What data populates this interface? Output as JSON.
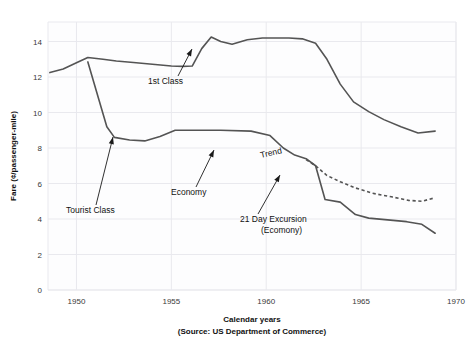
{
  "chart_data": {
    "type": "line",
    "title": "",
    "xlabel": "Calendar years",
    "xsublabel": "(Source: US Department of Commerce)",
    "ylabel": "Fare (¢/passenger-mile)",
    "xlim": [
      1948.5,
      1970.0
    ],
    "ylim": [
      0,
      15.1
    ],
    "xticks": [
      1950,
      1955,
      1960,
      1965,
      1970
    ],
    "xtick_labels": [
      "1950",
      "1955",
      "1960",
      "1965",
      "1970"
    ],
    "yticks": [
      0,
      2,
      4,
      6,
      8,
      10,
      12,
      14
    ],
    "ytick_labels": [
      "0",
      "2",
      "4",
      "6",
      "8",
      "10",
      "12",
      "14"
    ],
    "grid": true,
    "legend_position": "none",
    "line_color": "#545454",
    "series": [
      {
        "name": "1st Class",
        "style": "solid",
        "x": [
          1948.6,
          1949.3,
          1950.0,
          1950.6,
          1951.4,
          1952.1,
          1953.0,
          1954.0,
          1955.0,
          1955.6,
          1956.1,
          1956.6,
          1957.1,
          1957.6,
          1958.2,
          1959.0,
          1959.8,
          1960.6,
          1961.2,
          1961.9,
          1962.6,
          1963.2,
          1963.9,
          1964.6,
          1965.4,
          1966.2,
          1967.1,
          1968.0,
          1968.9
        ],
        "y": [
          12.25,
          12.45,
          12.8,
          13.1,
          13.0,
          12.9,
          12.82,
          12.72,
          12.62,
          12.6,
          12.62,
          13.6,
          14.25,
          14.0,
          13.85,
          14.1,
          14.2,
          14.2,
          14.2,
          14.15,
          13.9,
          13.0,
          11.6,
          10.6,
          10.05,
          9.6,
          9.2,
          8.85,
          8.95
        ]
      },
      {
        "name": "Tourist Class / Economy",
        "style": "solid",
        "x": [
          1950.6,
          1951.6,
          1952.0,
          1952.8,
          1953.6,
          1954.4,
          1955.2,
          1956.2,
          1957.6,
          1959.2,
          1960.2,
          1960.9,
          1961.5,
          1962.1,
          1962.6,
          1963.1,
          1963.9,
          1964.7,
          1965.4,
          1966.4,
          1967.4,
          1968.2,
          1968.9
        ],
        "y": [
          12.85,
          9.2,
          8.6,
          8.45,
          8.4,
          8.65,
          9.0,
          9.0,
          9.0,
          8.95,
          8.7,
          8.0,
          7.6,
          7.4,
          7.0,
          5.1,
          4.95,
          4.25,
          4.05,
          3.95,
          3.85,
          3.7,
          3.2
        ]
      },
      {
        "name": "21 Day Excursion (Ecomony)",
        "style": "dashed",
        "x": [
          1962.1,
          1962.6,
          1963.2,
          1963.9,
          1964.7,
          1965.6,
          1966.6,
          1967.5,
          1968.2,
          1968.9
        ],
        "y": [
          7.35,
          7.0,
          6.45,
          6.1,
          5.75,
          5.45,
          5.25,
          5.05,
          5.0,
          5.2
        ]
      }
    ],
    "annotations": [
      {
        "name": "1st Class",
        "label": "1st Class",
        "label_x": 148,
        "label_y": 84,
        "anchor": "start",
        "rotation": 0,
        "leader_from": [
          178,
          76
        ],
        "leader_to": [
          192,
          49
        ]
      },
      {
        "name": "Tourist Class",
        "label": "Tourist Class",
        "label_x": 66,
        "label_y": 213,
        "anchor": "start",
        "rotation": 0,
        "leader_from": [
          96,
          205
        ],
        "leader_to": [
          113,
          137
        ]
      },
      {
        "name": "Economy",
        "label": "Economy",
        "label_x": 171,
        "label_y": 195,
        "anchor": "start",
        "rotation": 0,
        "leader_from": [
          196,
          187
        ],
        "leader_to": [
          214,
          150
        ]
      },
      {
        "name": "Trend",
        "label": "Trend",
        "label_x": 261,
        "label_y": 158,
        "anchor": "start",
        "rotation": -13,
        "leader_from": null,
        "leader_to": null
      },
      {
        "name": "21 Day Excursion",
        "label": "21 Day Excursion",
        "label2": "(Ecomony)",
        "label_x": 240,
        "label_y": 222,
        "label2_x": 261,
        "label2_y": 233,
        "anchor": "start",
        "rotation": 0,
        "leader_from": [
          258,
          214
        ],
        "leader_to": [
          280,
          175
        ]
      }
    ]
  },
  "geometry": {
    "plot_left": 48,
    "plot_right": 456,
    "plot_top": 22,
    "plot_bottom": 290
  }
}
